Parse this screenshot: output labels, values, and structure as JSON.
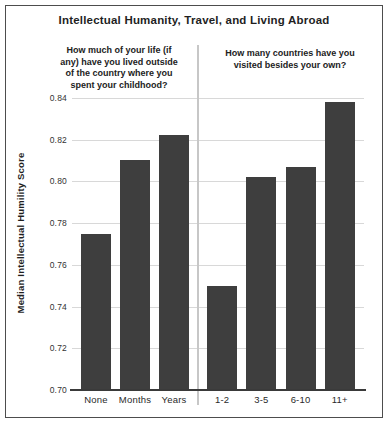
{
  "chart_data": {
    "type": "bar",
    "title": "Intellectual Humanity, Travel, and Living Abroad",
    "ylabel": "Median Intellectual Humility Score",
    "xlabel": "",
    "ylim": [
      0.7,
      0.85
    ],
    "yticks": [
      0.84,
      0.82,
      0.8,
      0.78,
      0.76,
      0.74,
      0.72,
      0.7
    ],
    "grid": true,
    "legend": "none",
    "bar_color": "#3e3e3e",
    "groups": [
      {
        "question": "How much of your life (if\nany) have you lived outside\nof the country where you\nspent your childhood?",
        "categories": [
          "None",
          "Months",
          "Years"
        ],
        "values": [
          0.775,
          0.81,
          0.822
        ]
      },
      {
        "question": "How many countries have you\nvisited besides your own?",
        "categories": [
          "1-2",
          "3-5",
          "6-10",
          "11+"
        ],
        "values": [
          0.75,
          0.802,
          0.807,
          0.838
        ]
      }
    ]
  }
}
